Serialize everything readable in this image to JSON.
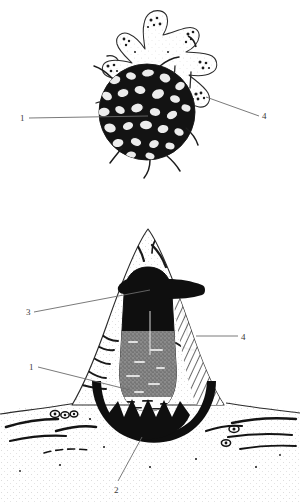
{
  "figure": {
    "background_color": "#ffffff",
    "ink_color": "#1a1a1a",
    "leader_line_color": "#6b6b6b",
    "label_text_color": "#3a3a3a"
  },
  "panels": [
    {
      "id": "top",
      "name": "star-shaped cell panel",
      "description": "Amoeboid star-shaped cell with about ten rounded lobes, each lobe stippled with dark granules, surrounding a large dense dark granular central body",
      "labels": [
        {
          "id": "1",
          "text": "1",
          "side": "left",
          "x": 20,
          "y": 114
        },
        {
          "id": "4",
          "text": "4",
          "side": "right",
          "x": 262,
          "y": 112
        }
      ]
    },
    {
      "id": "bottom",
      "name": "conical villus section panel",
      "description": "Cross-section of a conical villus-like projection rising from a stippled ground, containing a dark mushroom-capped column, a hatched fibrous right flank and a dark toothed basal band",
      "labels": [
        {
          "id": "3",
          "text": "3",
          "side": "left",
          "x": 26,
          "y": 308
        },
        {
          "id": "1",
          "text": "1",
          "side": "left",
          "x": 29,
          "y": 363
        },
        {
          "id": "4",
          "text": "4",
          "side": "right",
          "x": 241,
          "y": 333
        },
        {
          "id": "2",
          "text": "2",
          "side": "bottom",
          "x": 114,
          "y": 486
        }
      ]
    }
  ],
  "legend_numbers": [
    "1",
    "2",
    "3",
    "4"
  ]
}
